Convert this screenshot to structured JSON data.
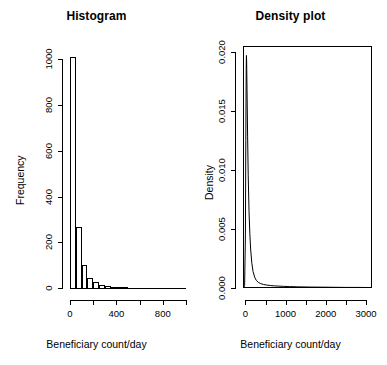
{
  "figure": {
    "width": 387,
    "height": 365,
    "background": "#ffffff",
    "foreground": "#000000"
  },
  "panels": [
    {
      "id": "histogram-panel",
      "title": "Histogram",
      "xlabel": "Beneficiary count/day",
      "ylabel": "Frequency"
    },
    {
      "id": "density-panel",
      "title": "Density plot",
      "xlabel": "Beneficiary count/day",
      "ylabel": "Density"
    }
  ],
  "chart_data": [
    {
      "type": "bar",
      "id": "histogram",
      "title": "Histogram",
      "xlabel": "Beneficiary count/day",
      "ylabel": "Frequency",
      "xlim": [
        0,
        1000
      ],
      "ylim": [
        0,
        1050
      ],
      "grid": false,
      "legend": "none",
      "xticks": [
        0,
        200,
        400,
        600,
        800,
        1000
      ],
      "xticklabels": [
        "0",
        "",
        "400",
        "",
        "800",
        ""
      ],
      "yticks": [
        0,
        200,
        400,
        600,
        800,
        1000
      ],
      "yticklabels": [
        "0",
        "200",
        "400",
        "600",
        "800",
        "1000"
      ],
      "bin_width": 50,
      "bin_starts": [
        0,
        50,
        100,
        150,
        200,
        250,
        300,
        350,
        400,
        450,
        500,
        550,
        600,
        650,
        700,
        750,
        800,
        850,
        900,
        950
      ],
      "categories": [
        "0-50",
        "50-100",
        "100-150",
        "150-200",
        "200-250",
        "250-300",
        "300-350",
        "350-400",
        "400-450",
        "450-500",
        "500-550",
        "550-600",
        "600-650",
        "650-700",
        "700-750",
        "750-800",
        "800-850",
        "850-900",
        "900-950",
        "950-1000"
      ],
      "values": [
        1010,
        265,
        100,
        42,
        25,
        14,
        9,
        6,
        4,
        3,
        2,
        2,
        1,
        1,
        1,
        1,
        0,
        0,
        0,
        1
      ]
    },
    {
      "type": "line",
      "id": "density",
      "title": "Density plot",
      "xlabel": "Beneficiary count/day",
      "ylabel": "Density",
      "xlim": [
        -60,
        3150
      ],
      "ylim": [
        0,
        0.0205
      ],
      "grid": false,
      "legend": "none",
      "xticks": [
        0,
        500,
        1000,
        1500,
        2000,
        2500,
        3000
      ],
      "xticklabels": [
        "0",
        "",
        "1000",
        "",
        "2000",
        "",
        "3000"
      ],
      "yticks": [
        0.0,
        0.005,
        0.01,
        0.015,
        0.02
      ],
      "yticklabels": [
        "0.000",
        "0.005",
        "0.010",
        "0.015",
        "0.020"
      ],
      "series": [
        {
          "name": "kernel density estimate",
          "x": [
            -40,
            -20,
            0,
            10,
            20,
            25,
            30,
            40,
            55,
            70,
            90,
            110,
            130,
            160,
            190,
            230,
            270,
            320,
            380,
            450,
            530,
            620,
            720,
            830,
            950,
            1100,
            1300,
            1600,
            1900,
            2200,
            2500,
            2800,
            3100
          ],
          "y": [
            2e-05,
            0.0002,
            0.0045,
            0.0125,
            0.0185,
            0.0197,
            0.0193,
            0.0168,
            0.0128,
            0.0095,
            0.0065,
            0.0046,
            0.0033,
            0.0021,
            0.0014,
            0.00092,
            0.00065,
            0.00048,
            0.00037,
            0.0003,
            0.00025,
            0.00021,
            0.00018,
            0.00016,
            0.00014,
            0.00012,
            0.0001,
            8e-05,
            7e-05,
            6e-05,
            5e-05,
            5e-05,
            4e-05
          ]
        }
      ]
    }
  ]
}
